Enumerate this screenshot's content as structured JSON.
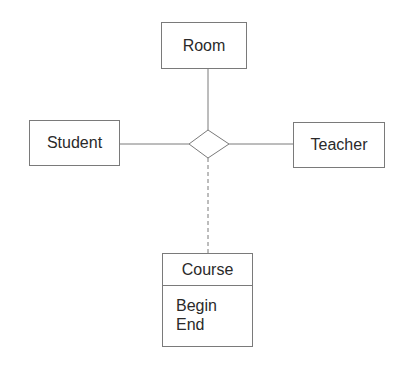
{
  "diagram": {
    "type": "ER diagram (ternary relationship with association class)",
    "entities": [
      {
        "id": "room",
        "label": "Room"
      },
      {
        "id": "student",
        "label": "Student"
      },
      {
        "id": "teacher",
        "label": "Teacher"
      }
    ],
    "relationship": {
      "shape": "diamond",
      "connects": [
        "room",
        "student",
        "teacher"
      ]
    },
    "association_class": {
      "name": "Course",
      "attributes": [
        "Begin",
        "End"
      ],
      "link_style": "dashed"
    },
    "colors": {
      "line": "#7a7a7a",
      "text": "#2a2a2a",
      "background": "#ffffff"
    }
  }
}
